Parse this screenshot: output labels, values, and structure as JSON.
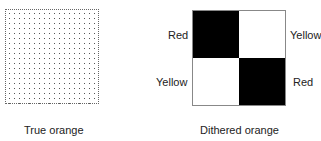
{
  "true_orange": {
    "caption": "True orange",
    "pattern": "fine dot stipple"
  },
  "dithered_orange": {
    "caption": "Dithered orange",
    "cells": [
      {
        "position": "top-left",
        "fill": "#000000",
        "label": "Red"
      },
      {
        "position": "top-right",
        "fill": "#ffffff",
        "label": "Yellow"
      },
      {
        "position": "bottom-left",
        "fill": "#ffffff",
        "label": "Yellow"
      },
      {
        "position": "bottom-right",
        "fill": "#000000",
        "label": "Red"
      }
    ]
  }
}
